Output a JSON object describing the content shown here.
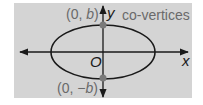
{
  "diagram": {
    "title": "co-vertices",
    "background_color": "#d4d4d4",
    "curve_color": "#1a1a1a",
    "point_color": "#7a7a7a",
    "axes": {
      "x_label": "x",
      "y_label": "y",
      "origin_label": "O"
    },
    "ellipse": {
      "cx": 103,
      "cy": 52,
      "rx": 52,
      "ry": 27
    },
    "points": [
      {
        "name": "top-co-vertex",
        "label_prefix": "(0, ",
        "label_var": "b",
        "label_suffix": ")"
      },
      {
        "name": "bottom-co-vertex",
        "label_prefix": "(0, ",
        "label_var": "−b",
        "label_suffix": ")"
      }
    ]
  }
}
